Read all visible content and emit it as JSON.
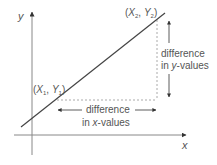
{
  "diagram": {
    "type": "slope-illustration",
    "axes": {
      "x_label": "x",
      "y_label": "y"
    },
    "points": [
      {
        "label": "(X1, Y1)",
        "var_x": "X",
        "sub_x": "1",
        "var_y": "Y",
        "sub_y": "1",
        "x": 55,
        "y": 100
      },
      {
        "label": "(X2, Y2)",
        "var_x": "X",
        "sub_x": "2",
        "var_y": "Y",
        "sub_y": "2",
        "x": 157,
        "y": 19
      }
    ],
    "annotations": {
      "y_difference": {
        "line1": "difference",
        "line2": "in y-values",
        "line2_pre": "in ",
        "line2_var": "y",
        "line2_post": "-values"
      },
      "x_difference": {
        "line1": "difference",
        "line2": "in x-values",
        "line2_pre": "in ",
        "line2_var": "x",
        "line2_post": "-values"
      }
    },
    "colors": {
      "line": "#444444",
      "axis": "#888888",
      "dashed": "#aaaaaa",
      "arrow": "#333333",
      "text": "#555555"
    }
  }
}
